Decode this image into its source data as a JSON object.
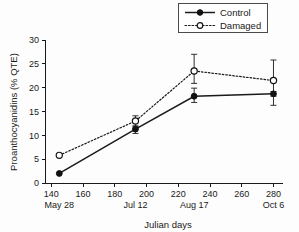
{
  "chart_data": {
    "type": "line",
    "title": "",
    "xlabel": "Julian days",
    "ylabel": "Proanthocyanidins (% QTE)",
    "xlim": [
      136,
      286
    ],
    "ylim": [
      0,
      30
    ],
    "xticks": [
      140,
      160,
      180,
      200,
      220,
      240,
      260,
      280
    ],
    "yticks": [
      0,
      5,
      10,
      15,
      20,
      25,
      30
    ],
    "grid": false,
    "legend_position": "top-right",
    "secondary_xtick_labels": [
      {
        "x": 145,
        "label": "May 28"
      },
      {
        "x": 193,
        "label": "Jul 12"
      },
      {
        "x": 230,
        "label": "Aug 17"
      },
      {
        "x": 280,
        "label": "Oct 6"
      }
    ],
    "x": [
      145,
      193,
      230,
      280
    ],
    "series": [
      {
        "name": "Control",
        "marker": "filled-circle",
        "linestyle": "solid",
        "values": [
          2.0,
          11.3,
          18.2,
          18.7
        ],
        "err_low": [
          2.0,
          10.4,
          16.9,
          16.3
        ],
        "err_high": [
          2.0,
          12.0,
          19.9,
          19.2
        ]
      },
      {
        "name": "Damaged",
        "marker": "open-circle",
        "linestyle": "dotted",
        "values": [
          5.8,
          13.0,
          23.5,
          21.5
        ],
        "err_low": [
          5.8,
          11.8,
          20.9,
          18.2
        ],
        "err_high": [
          5.8,
          14.1,
          27.0,
          25.8
        ]
      }
    ]
  },
  "legend": {
    "items": [
      {
        "label": "Control",
        "style": "solid-filled"
      },
      {
        "label": "Damaged",
        "style": "dotted-open"
      }
    ]
  },
  "colors": {
    "ink": "#1a1a1a",
    "background": "#ffffff",
    "marker_fill_open": "#ffffff"
  }
}
